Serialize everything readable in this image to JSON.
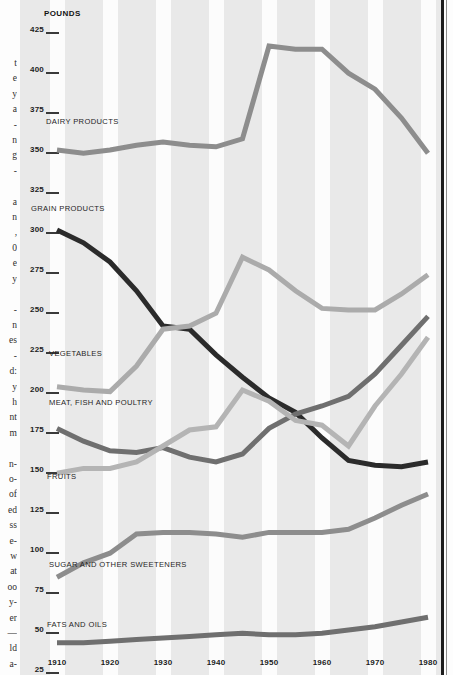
{
  "axis": {
    "unit_label": "POUNDS",
    "y_ticks": [
      425,
      400,
      375,
      350,
      325,
      300,
      275,
      250,
      225,
      200,
      175,
      150,
      125,
      100,
      75,
      50,
      25
    ],
    "x_ticks": [
      1910,
      1920,
      1930,
      1940,
      1950,
      1960,
      1970,
      1980
    ]
  },
  "series_labels": {
    "dairy": "DAIRY PRODUCTS",
    "grain": "GRAIN PRODUCTS",
    "vegetables": "VEGETABLES",
    "meat": "MEAT, FISH AND POULTRY",
    "fruits": "FRUITS",
    "sugar": "SUGAR AND OTHER SWEETENERS",
    "fats": "FATS AND OILS"
  },
  "gutter_text": "t\ne\ny\na\n-\nn\ng\n-\n\na\nn\n,\n0\ne\ny\n\n-\nn\nes\n-\nd:\ny\nh\nnt\nm\n\nn-\no-\nof\ned\nss\ne-\nw\nat\noo\ny-\ner\n—\nld\na-",
  "colors": {
    "plate_background": "#e9e9e9",
    "band": "#fcfcfc",
    "dairy": "#8d8d8d",
    "grain": "#2b2b2b",
    "vegetables": "#ababab",
    "meat": "#6f6f6f",
    "fruits": "#b4b4b4",
    "sugar": "#8d8d8d",
    "fats": "#6f6f6f",
    "axis_text": "#1c1c1c",
    "border_rule": "#1d1d1d"
  },
  "chart_data": {
    "type": "line",
    "title": "",
    "xlabel": "",
    "ylabel": "POUNDS",
    "xlim": [
      1910,
      1980
    ],
    "ylim": [
      25,
      425
    ],
    "grid": "vertical-bands",
    "legend": "inline-labels",
    "x": [
      1910,
      1915,
      1920,
      1925,
      1930,
      1935,
      1940,
      1945,
      1950,
      1955,
      1960,
      1965,
      1970,
      1975,
      1980
    ],
    "series": [
      {
        "name": "DAIRY PRODUCTS",
        "color": "#8d8d8d",
        "values": [
          350,
          348,
          350,
          353,
          355,
          353,
          352,
          357,
          415,
          413,
          413,
          398,
          388,
          370,
          348
        ]
      },
      {
        "name": "GRAIN PRODUCTS",
        "color": "#2b2b2b",
        "values": [
          300,
          292,
          280,
          262,
          240,
          238,
          222,
          208,
          195,
          186,
          170,
          156,
          153,
          152,
          155
        ]
      },
      {
        "name": "VEGETABLES",
        "color": "#ababab",
        "values": [
          202,
          200,
          199,
          215,
          238,
          240,
          248,
          283,
          275,
          262,
          251,
          250,
          250,
          260,
          272
        ]
      },
      {
        "name": "MEAT, FISH AND POULTRY",
        "color": "#6f6f6f",
        "values": [
          176,
          168,
          162,
          161,
          164,
          158,
          155,
          160,
          176,
          185,
          190,
          196,
          210,
          228,
          246
        ]
      },
      {
        "name": "FRUITS",
        "color": "#b4b4b4",
        "values": [
          148,
          151,
          151,
          155,
          165,
          175,
          177,
          200,
          193,
          181,
          178,
          165,
          190,
          210,
          233
        ]
      },
      {
        "name": "SUGAR AND OTHER SWEETENERS",
        "color": "#8d8d8d",
        "values": [
          83,
          92,
          98,
          110,
          111,
          111,
          110,
          108,
          111,
          111,
          111,
          113,
          120,
          128,
          135
        ]
      },
      {
        "name": "FATS AND OILS",
        "color": "#6f6f6f",
        "values": [
          42,
          42,
          43,
          44,
          45,
          46,
          47,
          48,
          47,
          47,
          48,
          50,
          52,
          55,
          58
        ]
      }
    ]
  }
}
